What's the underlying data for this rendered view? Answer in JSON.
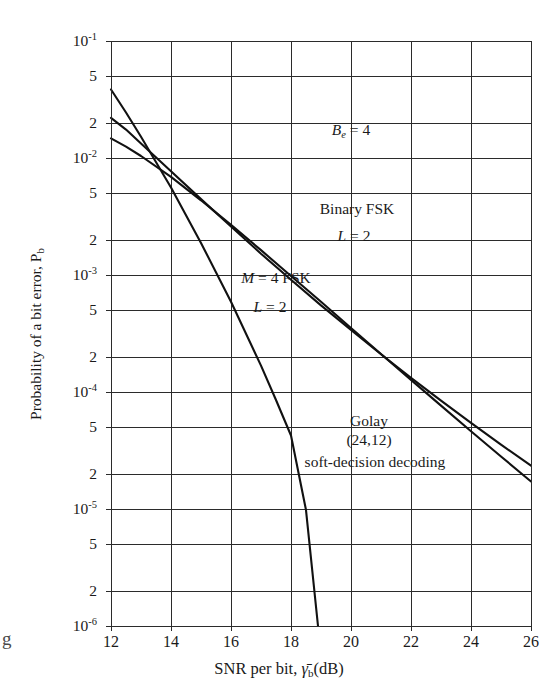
{
  "chart_data": {
    "type": "line",
    "title": "",
    "xlabel": "SNR per bit, γ̄_b (dB)",
    "ylabel": "Probability of a bit error, P_b",
    "xlim": [
      12,
      26
    ],
    "ylim": [
      1e-06,
      0.1
    ],
    "yscale": "log",
    "grid": true,
    "legend_position": "inline-annotations",
    "x_ticks": [
      12,
      14,
      16,
      18,
      20,
      22,
      24,
      26
    ],
    "x_tick_labels": [
      "12",
      "14",
      "16",
      "18",
      "20",
      "22",
      "24",
      "26"
    ],
    "y_ticks": [
      0.1,
      0.05,
      0.02,
      0.01,
      0.005,
      0.002,
      0.001,
      0.0005,
      0.0002,
      0.0001,
      5e-05,
      2e-05,
      1e-05,
      5e-06,
      2e-06,
      1e-06
    ],
    "y_tick_labels": [
      "10⁻¹",
      "5",
      "2",
      "10⁻²",
      "5",
      "2",
      "10⁻³",
      "5",
      "2",
      "10⁻⁴",
      "5",
      "2",
      "10⁻⁵",
      "5",
      "2",
      "10⁻⁶"
    ],
    "series": [
      {
        "name": "Binary FSK, L = 2",
        "points": [
          [
            12.0,
            0.022
          ],
          [
            12.5,
            0.0175
          ],
          [
            13.0,
            0.0133
          ],
          [
            14.0,
            0.0077
          ],
          [
            15.0,
            0.00445
          ],
          [
            16.0,
            0.0026
          ],
          [
            17.0,
            0.00152
          ],
          [
            18.0,
            0.00091
          ],
          [
            19.0,
            0.00055
          ],
          [
            20.0,
            0.00034
          ],
          [
            21.0,
            0.00021
          ],
          [
            22.0,
            0.000132
          ],
          [
            23.0,
            8.45e-05
          ],
          [
            24.0,
            5.45e-05
          ],
          [
            25.0,
            3.55e-05
          ],
          [
            26.0,
            2.35e-05
          ]
        ]
      },
      {
        "name": "M = 4 FSK, L = 2",
        "points": [
          [
            12.0,
            0.0147
          ],
          [
            12.5,
            0.0125
          ],
          [
            13.0,
            0.0104
          ],
          [
            14.0,
            0.0069
          ],
          [
            15.0,
            0.00435
          ],
          [
            16.0,
            0.00268
          ],
          [
            17.0,
            0.00163
          ],
          [
            18.0,
            0.00098
          ],
          [
            19.0,
            0.00059
          ],
          [
            20.0,
            0.000352
          ],
          [
            21.0,
            0.000211
          ],
          [
            22.0,
            0.000127
          ],
          [
            23.0,
            7.65e-05
          ],
          [
            24.0,
            4.62e-05
          ],
          [
            25.0,
            2.81e-05
          ],
          [
            26.0,
            1.72e-05
          ]
        ]
      },
      {
        "name": "Golay (24,12) soft-decision decoding",
        "points": [
          [
            12.0,
            0.0385
          ],
          [
            12.5,
            0.0245
          ],
          [
            13.0,
            0.0152
          ],
          [
            14.0,
            0.0056
          ],
          [
            15.0,
            0.00188
          ],
          [
            16.0,
            0.00059
          ],
          [
            17.0,
            0.000168
          ],
          [
            17.5,
            8.55e-05
          ],
          [
            18.0,
            4.25e-05
          ],
          [
            18.5,
            9.8e-06
          ],
          [
            18.9,
            1e-06
          ]
        ]
      }
    ],
    "annotations": [
      {
        "id": "be",
        "text": "B_e = 4",
        "x": 20.0,
        "y": 0.017
      },
      {
        "id": "binary_fsk",
        "text": "Binary FSK",
        "x": 20.2,
        "y": 0.0036
      },
      {
        "id": "binary_fsk_l",
        "text": "L = 2",
        "x": 20.1,
        "y": 0.0021
      },
      {
        "id": "m4_fsk",
        "text": "M = 4 FSK",
        "x": 17.5,
        "y": 0.00093
      },
      {
        "id": "m4_fsk_l",
        "text": "L = 2",
        "x": 17.3,
        "y": 0.00052
      },
      {
        "id": "golay1",
        "text": "Golay",
        "x": 20.6,
        "y": 5.5e-05
      },
      {
        "id": "golay2",
        "text": "(24,12)",
        "x": 20.6,
        "y": 3.85e-05
      },
      {
        "id": "golay3",
        "text": "soft-decision decoding",
        "x": 20.8,
        "y": 2.45e-05
      }
    ]
  },
  "axes": {
    "y_title_prefix": "Probability of a bit error, P",
    "y_title_sub": "b",
    "x_title_prefix": "SNR per bit, ",
    "x_title_gamma": "γ̄",
    "x_title_sub": "b",
    "x_title_suffix": "(dB)"
  },
  "annotation_labels": {
    "be_italic": "B",
    "be_sub": "e",
    "be_rest": "= 4",
    "binary_fsk": "Binary FSK",
    "l_italic": "L",
    "l_rest": "= 2",
    "m_italic": "M",
    "m_rest": "= 4 FSK",
    "golay_line1": "Golay",
    "golay_line2": "(24,12)",
    "golay_line3": "soft-decision decoding"
  },
  "page_artifact": {
    "edge_glyph": "g"
  },
  "colors": {
    "ink": "#1a1a1a",
    "grid": "#2b2b2b",
    "curve": "#111111",
    "background": "#ffffff"
  }
}
